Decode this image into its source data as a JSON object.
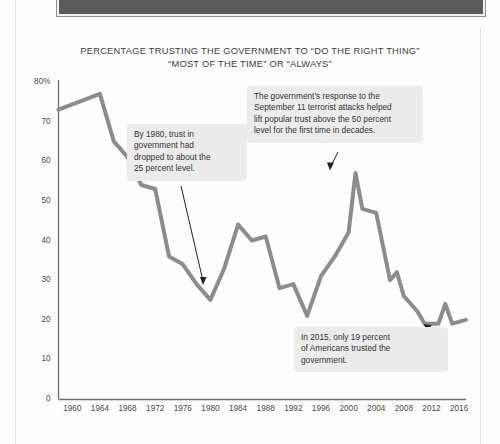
{
  "page": {
    "header_band_label": ""
  },
  "chart_data": {
    "type": "line",
    "title": "PERCENTAGE TRUSTING THE GOVERNMENT TO “DO THE RIGHT THING”\n“MOST OF THE TIME” OR “ALWAYS”",
    "xlabel": "",
    "ylabel": "",
    "xlim": [
      1958,
      2017
    ],
    "ylim": [
      0,
      80
    ],
    "grid": false,
    "legend": "none",
    "line_color": "#8c8c8c",
    "axis_color": "#6f6f6f",
    "y_ticks": [
      "0",
      "10",
      "20",
      "30",
      "40",
      "50",
      "60",
      "70",
      "80%"
    ],
    "y_tick_values": [
      0,
      10,
      20,
      30,
      40,
      50,
      60,
      70,
      80
    ],
    "x_ticks": [
      "1960",
      "1964",
      "1968",
      "1972",
      "1976",
      "1980",
      "1984",
      "1988",
      "1992",
      "1996",
      "2000",
      "2004",
      "2008",
      "2012",
      "2016"
    ],
    "x_tick_values": [
      1960,
      1964,
      1968,
      1972,
      1976,
      1980,
      1984,
      1988,
      1992,
      1996,
      2000,
      2004,
      2008,
      2012,
      2016
    ],
    "series": [
      {
        "name": "Trust in government",
        "x": [
          1958,
          1964,
          1966,
          1968,
          1970,
          1972,
          1974,
          1976,
          1978,
          1980,
          1982,
          1984,
          1986,
          1988,
          1990,
          1992,
          1994,
          1996,
          1998,
          2000,
          2001,
          2002,
          2004,
          2006,
          2007,
          2008,
          2010,
          2011,
          2013,
          2014,
          2015,
          2017
        ],
        "values": [
          73,
          77,
          65,
          61,
          54,
          53,
          36,
          34,
          29,
          25,
          33,
          44,
          40,
          41,
          28,
          29,
          21,
          31,
          36,
          42,
          57,
          48,
          47,
          30,
          32,
          26,
          22,
          19,
          19,
          24,
          19,
          20
        ]
      }
    ],
    "annotations": [
      {
        "id": "callout-1980",
        "text": "By 1980, trust in\ngovernment had\ndropped to about the\n25 percent level.",
        "points_to_year": 1980,
        "points_to_value": 25
      },
      {
        "id": "callout-2001",
        "text": "The government’s response to the\nSeptember 11 terrorist attacks helped\nlift popular trust above the 50 percent\nlevel for the first time in decades.",
        "points_to_year": 2001,
        "points_to_value": 57
      },
      {
        "id": "callout-2015",
        "text": "In 2015, only 19 percent\nof Americans trusted the\ngovernment.",
        "points_to_year": 2015,
        "points_to_value": 19
      }
    ]
  }
}
